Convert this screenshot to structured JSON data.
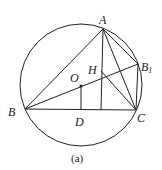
{
  "diagram": {
    "caption": "(a)",
    "labels": {
      "A": "A",
      "B": "B",
      "C": "C",
      "B1": "B",
      "B1_sub": "1",
      "O": "O",
      "H": "H",
      "D": "D"
    },
    "points": {
      "A": [
        103,
        29
      ],
      "B": [
        25,
        109
      ],
      "C": [
        136,
        110
      ],
      "B1": [
        138,
        64
      ],
      "O": [
        81,
        86
      ],
      "D": [
        81,
        109
      ],
      "H": [
        101,
        71
      ],
      "altitude_foot": [
        101,
        110
      ]
    },
    "circle": {
      "center": [
        81,
        85
      ],
      "r": 61
    },
    "colors": {
      "stroke": "#222222",
      "background": "#ffffff"
    }
  }
}
